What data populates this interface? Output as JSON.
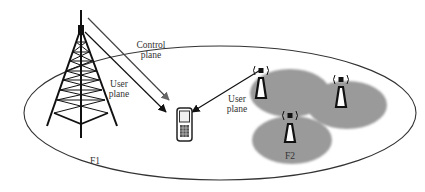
{
  "diagram": {
    "type": "heterogeneous-network",
    "labels": {
      "control_plane_line1": "Control",
      "control_plane_line2": "plane",
      "user_plane_macro_line1": "User",
      "user_plane_macro_line2": "plane",
      "user_plane_small_line1": "User",
      "user_plane_small_line2": "plane",
      "macro_cell": "F1",
      "small_cells": "F2"
    },
    "nodes": [
      {
        "id": "macro-tower",
        "kind": "macro-base-station",
        "layer": "F1"
      },
      {
        "id": "small-cell-1",
        "kind": "small-cell",
        "layer": "F2"
      },
      {
        "id": "small-cell-2",
        "kind": "small-cell",
        "layer": "F2"
      },
      {
        "id": "small-cell-3",
        "kind": "small-cell",
        "layer": "F2"
      },
      {
        "id": "ue",
        "kind": "mobile-phone"
      }
    ],
    "edges": [
      {
        "from": "macro-tower",
        "to": "ue",
        "label": "Control plane"
      },
      {
        "from": "macro-tower",
        "to": "ue",
        "label": "User plane"
      },
      {
        "from": "small-cell-1",
        "to": "ue",
        "label": "User plane"
      }
    ],
    "colors": {
      "line": "#222222",
      "control_arrow": "#666666",
      "small_cell_fill": "#999999",
      "text": "#333333"
    }
  }
}
